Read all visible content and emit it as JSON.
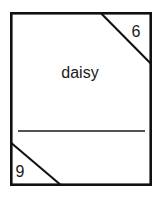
{
  "figure": {
    "type": "labeled-box-diagram",
    "background_color": "#ffffff",
    "line_color": "#111111",
    "text_color": "#1a1a1a",
    "center_label": "daisy",
    "corner_labels": {
      "top_right": "6",
      "bottom_left": "9"
    },
    "elements": {
      "frame_name": "outer-rectangle",
      "divider_name": "horizontal-divider",
      "top_right_diagonal_name": "top-right-corner-diagonal",
      "bottom_left_diagonal_name": "bottom-left-corner-diagonal"
    }
  }
}
